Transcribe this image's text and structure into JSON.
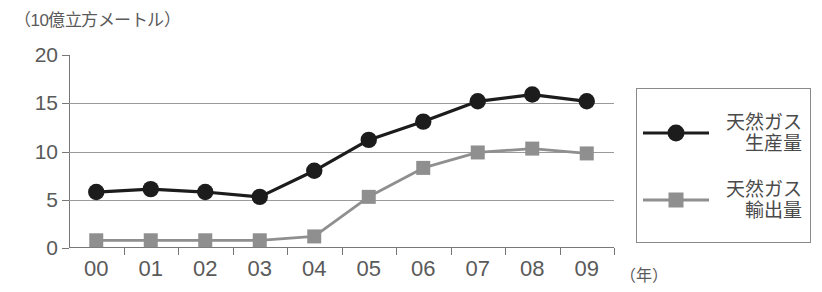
{
  "chart_data": {
    "type": "line",
    "title": "",
    "ylabel": "（10億立方メートル）",
    "xlabel": "（年）",
    "categories": [
      "00",
      "01",
      "02",
      "03",
      "04",
      "05",
      "06",
      "07",
      "08",
      "09"
    ],
    "yticks": [
      0,
      5,
      10,
      15,
      20
    ],
    "ylim": [
      0,
      20
    ],
    "grid": true,
    "legend_position": "right",
    "series": [
      {
        "name": "天然ガス生産量",
        "name_line1": "天然ガス",
        "name_line2": "生産量",
        "marker": "circle",
        "color": "#1c1c1c",
        "values": [
          5.8,
          6.1,
          5.8,
          5.3,
          8.0,
          11.2,
          13.1,
          15.2,
          15.9,
          15.2
        ]
      },
      {
        "name": "天然ガス輸出量",
        "name_line1": "天然ガス",
        "name_line2": "輸出量",
        "marker": "square",
        "color": "#8f8f8f",
        "values": [
          0.8,
          0.8,
          0.8,
          0.8,
          1.2,
          5.3,
          8.3,
          9.9,
          10.3,
          9.8
        ]
      }
    ]
  }
}
